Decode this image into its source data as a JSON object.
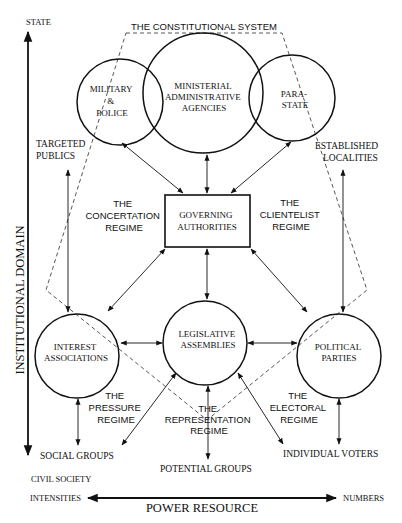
{
  "diagram": {
    "title": "THE CONSTITUTIONAL SYSTEM",
    "axes": {
      "vertical": {
        "label": "INSTITUTIONAL DOMAIN",
        "top": "STATE",
        "bottom": "CIVIL SOCIETY"
      },
      "horizontal": {
        "label": "POWER RESOURCE",
        "left": "INTENSITIES",
        "right": "NUMBERS"
      }
    },
    "nodes": {
      "military": {
        "lines": [
          "MILITARY",
          "&",
          "POLICE"
        ]
      },
      "ministerial": {
        "lines": [
          "MINISTERIAL",
          "ADMINISTRATIVE",
          "AGENCIES"
        ]
      },
      "parastate": {
        "lines": [
          "PARA-",
          "STATE"
        ]
      },
      "governing": {
        "lines": [
          "GOVERNING",
          "AUTHORITIES"
        ]
      },
      "interest": {
        "lines": [
          "INTEREST",
          "ASSOCIATIONS"
        ]
      },
      "legislative": {
        "lines": [
          "LEGISLATIVE",
          "ASSEMBLIES"
        ]
      },
      "political": {
        "lines": [
          "POLITICAL",
          "PARTIES"
        ]
      }
    },
    "outer_labels": {
      "targeted_publics": [
        "TARGETED",
        "PUBLICS"
      ],
      "established_localities": [
        "ESTABLISHED",
        "LOCALITIES"
      ],
      "social_groups": "SOCIAL GROUPS",
      "potential_groups": "POTENTIAL GROUPS",
      "individual_voters": "INDIVIDUAL VOTERS"
    },
    "regimes": {
      "concertation": [
        "THE",
        "CONCERTATION",
        "REGIME"
      ],
      "clientelist": [
        "THE",
        "CLIENTELIST",
        "REGIME"
      ],
      "pressure": [
        "THE",
        "PRESSURE",
        "REGIME"
      ],
      "representation": [
        "THE",
        "REPRESENTATION",
        "REGIME"
      ],
      "electoral": [
        "THE",
        "ELECTORAL",
        "REGIME"
      ]
    }
  }
}
